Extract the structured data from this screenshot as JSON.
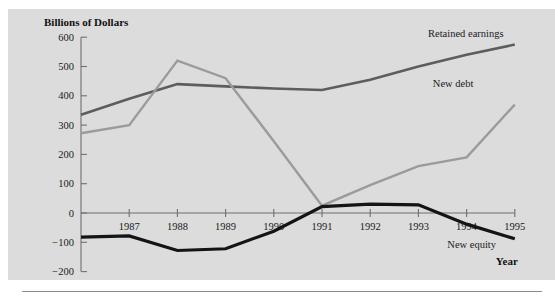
{
  "figure": {
    "y_axis_title": "Billions of Dollars",
    "x_axis_title": "Year",
    "plate_color": "#dcdcdc",
    "axis_color": "#6f6f6f"
  },
  "chart_data": {
    "type": "line",
    "title": "",
    "xlabel": "Year",
    "ylabel": "Billions of Dollars",
    "categories": [
      "1987",
      "1988",
      "1989",
      "1990",
      "1991",
      "1992",
      "1993",
      "1994",
      "1995"
    ],
    "x": [
      1987,
      1988,
      1989,
      1990,
      1991,
      1992,
      1993,
      1994,
      1995
    ],
    "x_extra_start": 1986,
    "xlim": [
      1986,
      1995
    ],
    "ylim": [
      -200,
      600
    ],
    "yticks": [
      -200,
      -100,
      0,
      100,
      200,
      300,
      400,
      500,
      600
    ],
    "ytick_labels": [
      "−200",
      "−100",
      "0",
      "100",
      "200",
      "300",
      "400",
      "500",
      "600"
    ],
    "xtick_labels": [
      "1987",
      "1988",
      "1989",
      "1990",
      "1991",
      "1992",
      "1993",
      "1994",
      "1995"
    ],
    "grid": false,
    "legend_position": "inline-labels",
    "series": [
      {
        "name": "Retained earnings",
        "color": "#5d5d5d",
        "width": 2.6,
        "x": [
          1986,
          1987,
          1988,
          1989,
          1990,
          1991,
          1992,
          1993,
          1994,
          1995
        ],
        "values": [
          335,
          390,
          440,
          432,
          425,
          420,
          455,
          500,
          540,
          575
        ],
        "label_x": 1993.2,
        "label_y": 600
      },
      {
        "name": "New debt",
        "color": "#9b9b9b",
        "width": 2.4,
        "x": [
          1986,
          1987,
          1988,
          1989,
          1990,
          1991,
          1992,
          1993,
          1994,
          1995
        ],
        "values": [
          272,
          300,
          520,
          460,
          245,
          25,
          95,
          160,
          190,
          370
        ],
        "label_x": 1993.3,
        "label_y": 430
      },
      {
        "name": "New equity",
        "color": "#141414",
        "width": 3.2,
        "x": [
          1986,
          1987,
          1988,
          1989,
          1990,
          1991,
          1992,
          1993,
          1994,
          1995
        ],
        "values": [
          -82,
          -78,
          -128,
          -122,
          -62,
          22,
          30,
          28,
          -38,
          -88
        ],
        "label_x": 1993.6,
        "label_y": -118
      }
    ]
  }
}
